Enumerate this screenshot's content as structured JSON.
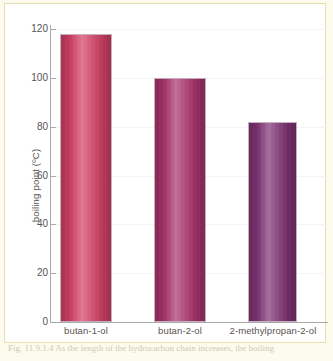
{
  "figure": {
    "background_color": "#fdfbee",
    "plot_background_color": "#ffffff",
    "frame_color": "#e8dfae",
    "axis_color": "#a9a9a9",
    "caption_partial": "Fig.  11.9.1.4 As the length of the hydrocarbon chain increases, the boiling"
  },
  "chart_data": {
    "type": "bar",
    "title": "",
    "xlabel": "",
    "ylabel": "boiling point (ºC)",
    "categories": [
      "butan-1-ol",
      "butan-2-ol",
      "2-methylpropan-2-ol"
    ],
    "values": [
      118,
      100,
      82
    ],
    "ylim": [
      0,
      126
    ],
    "yticks": [
      0,
      20,
      40,
      60,
      80,
      100,
      120
    ],
    "ytick_labels": [
      "0",
      "20",
      "40",
      "60",
      "80",
      "100",
      "120"
    ],
    "grid": false,
    "legend": null,
    "series": [
      {
        "name": "boiling point",
        "values": [
          118,
          100,
          82
        ],
        "colors": [
          "#d23f64",
          "#a8326b",
          "#7e3273"
        ]
      }
    ],
    "bar_colors": {
      "butan-1-ol": "#d23f64",
      "butan-2-ol": "#a8326b",
      "2-methylpropan-2-ol": "#7e3273"
    }
  }
}
